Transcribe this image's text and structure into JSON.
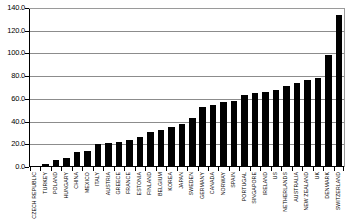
{
  "chart_data": {
    "type": "bar",
    "title": "",
    "subtitle": "",
    "xlabel": "",
    "ylabel": "",
    "ylim": [
      0,
      140
    ],
    "ytick_labels": [
      "140.0",
      "120.0",
      "100.0",
      "80.0",
      "60.0",
      "40.0",
      "20.0",
      "0.0"
    ],
    "ytick_values": [
      140,
      120,
      100,
      80,
      60,
      40,
      20,
      0
    ],
    "grid": true,
    "legend": false,
    "legend_position": "none",
    "bar_color": "#000000",
    "categories": [
      "CZECH REPUBLIC",
      "TURKEY",
      "POLAND",
      "HUNGARY",
      "CHINA",
      "MEXICO",
      "ITALY",
      "AUSTRIA",
      "GREECE",
      "FRANCE",
      "ESTONIA",
      "FINLAND",
      "BELGIUM",
      "KOREA",
      "JAPAN",
      "SWEDEN",
      "GERMANY",
      "CANADA",
      "NORWAY",
      "SPAIN",
      "PORTUGAL",
      "SINGAPORE",
      "IRELAND",
      "US",
      "NETHERLANDS",
      "AUSTRALIA",
      "NEW ZEALAND",
      "UK",
      "DENMARK",
      "SWITZERLAND"
    ],
    "values": [
      1.0,
      3.0,
      6.0,
      8.0,
      13.0,
      14.0,
      20.0,
      21.0,
      22.0,
      24.0,
      26.0,
      31.0,
      33.0,
      35.0,
      38.0,
      43.0,
      53.0,
      55.0,
      57.0,
      58.0,
      63.0,
      65.0,
      66.0,
      68.0,
      71.0,
      74.0,
      77.0,
      78.0,
      99.0,
      134.0
    ]
  }
}
